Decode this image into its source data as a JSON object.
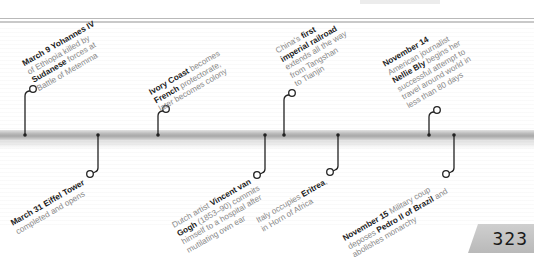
{
  "page": {
    "number": "323"
  },
  "timeline": {
    "events_above": [
      {
        "id": "yohannes",
        "lines": [
          [
            {
              "b": "March 9"
            },
            {
              "t": " "
            },
            {
              "b": "Yohannes IV"
            }
          ],
          [
            {
              "t": "of Ethiopia killed by"
            }
          ],
          [
            {
              "b": "Sudanese"
            },
            {
              "t": " forces at"
            }
          ],
          [
            {
              "t": "Battle of Metemma"
            }
          ]
        ],
        "text": "March 9 Yohannes IV of Ethiopia killed by Sudanese forces at Battle of Metemma"
      },
      {
        "id": "ivory-coast",
        "lines": [
          [
            {
              "b": "Ivory Coast"
            },
            {
              "t": " becomes"
            }
          ],
          [
            {
              "b": "French"
            },
            {
              "t": " protectorate,"
            }
          ],
          [
            {
              "t": "later becomes colony"
            }
          ]
        ],
        "text": "Ivory Coast becomes French protectorate, later becomes colony"
      },
      {
        "id": "china-railroad",
        "lines": [
          [
            {
              "t": "China's "
            },
            {
              "b": "first"
            }
          ],
          [
            {
              "b": "imperial railroad"
            }
          ],
          [
            {
              "t": "extends all the way"
            }
          ],
          [
            {
              "t": "from Tangshan"
            }
          ],
          [
            {
              "t": "to Tianjin"
            }
          ]
        ],
        "text": "China's first imperial railroad extends all the way from Tangshan to Tianjin"
      },
      {
        "id": "nellie-bly",
        "lines": [
          [
            {
              "b": "November 14"
            }
          ],
          [
            {
              "t": "American journalist"
            }
          ],
          [
            {
              "b": "Nellie Bly"
            },
            {
              "t": " begins her"
            }
          ],
          [
            {
              "t": "successful attempt to"
            }
          ],
          [
            {
              "t": "travel around world in"
            }
          ],
          [
            {
              "t": "less than 80 days"
            }
          ]
        ],
        "text": "November 14 American journalist Nellie Bly begins her successful attempt to travel around world in less than 80 days"
      }
    ],
    "events_below": [
      {
        "id": "eiffel",
        "lines": [
          [
            {
              "b": "March 31 Eiffel Tower"
            }
          ],
          [
            {
              "t": "completed and opens"
            }
          ]
        ],
        "text": "March 31 Eiffel Tower completed and opens"
      },
      {
        "id": "van-gogh",
        "lines": [
          [
            {
              "t": "Dutch artist "
            },
            {
              "b": "Vincent van"
            }
          ],
          [
            {
              "b": "Gogh"
            },
            {
              "t": " (1853–90) commits"
            }
          ],
          [
            {
              "t": "himself to a hospital after"
            }
          ],
          [
            {
              "t": "mutilating own ear"
            }
          ]
        ],
        "text": "Dutch artist Vincent van Gogh (1853–90) commits himself to a hospital after mutilating own ear"
      },
      {
        "id": "eritrea",
        "lines": [
          [
            {
              "t": "Italy occupies "
            },
            {
              "b": "Eritrea"
            },
            {
              "t": ","
            }
          ],
          [
            {
              "t": "in Horn of Africa"
            }
          ]
        ],
        "text": "Italy occupies Eritrea, in Horn of Africa"
      },
      {
        "id": "brazil",
        "lines": [
          [
            {
              "b": "November 15"
            },
            {
              "t": " Military coup"
            }
          ],
          [
            {
              "t": "deposes "
            },
            {
              "b": "Pedro II of Brazil"
            },
            {
              "t": " and"
            }
          ],
          [
            {
              "t": "abolishes monarchy"
            }
          ]
        ],
        "text": "November 15 Military coup deposes Pedro II of Brazil and abolishes monarchy"
      }
    ]
  },
  "colors": {
    "bar": "#b0b0b0",
    "connector": "#222222",
    "text_bold": "#1a1a1a",
    "text_light": "#8a8a8a",
    "badge": "#c4c4c4"
  }
}
